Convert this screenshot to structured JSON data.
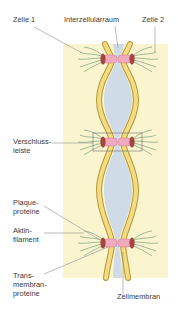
{
  "diagram": {
    "type": "cell-junction-illustration",
    "labels": {
      "zelle1": "Zelle 1",
      "interzellularraum": "Interzellularraum",
      "zelle2": "Zelle 2",
      "verschlussleiste": [
        "Verschluss-",
        "leiste"
      ],
      "plaqueproteine": [
        "Plaque-",
        "proteine"
      ],
      "aktinfilament": [
        "Aktin-",
        "filament"
      ],
      "transmembranproteine": [
        "Trans-",
        "membran-",
        "proteine"
      ],
      "zellmembran": "Zellmembran"
    },
    "colors": {
      "cell_background": "#fbf5cf",
      "membrane_fill": "#f3dc86",
      "membrane_edge": "#b8952f",
      "intercellular_space": "#cfdbe6",
      "plaque": "#efaabf",
      "plaque_edge": "#cc7a92",
      "end_cap": "#a8443f",
      "filament": "#5c8f74",
      "leader_line": "#8f8f8f",
      "frame": "#6e6e6e"
    },
    "junctions": [
      {
        "name": "upper-junction",
        "y": 59
      },
      {
        "name": "middle-junction-verschlussleiste",
        "y": 142
      },
      {
        "name": "lower-junction",
        "y": 243
      }
    ]
  }
}
